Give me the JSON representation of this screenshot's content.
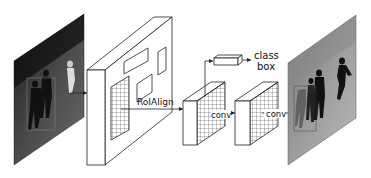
{
  "diagram": {
    "type": "mask-rcnn-architecture",
    "labels": {
      "roialign": "RoIAlign",
      "conv1": "conv",
      "conv2": "conv",
      "class": "class",
      "box": "box"
    },
    "nodes": [
      {
        "id": "input-image",
        "kind": "image",
        "description": "input photo of soccer players with bounding box"
      },
      {
        "id": "feature-map",
        "kind": "3d-slab",
        "description": "backbone feature map with region proposals"
      },
      {
        "id": "roi-feature",
        "kind": "3d-grid-block",
        "description": "RoI aligned feature"
      },
      {
        "id": "fc-head",
        "kind": "bar",
        "description": "class/box head"
      },
      {
        "id": "mask-feature",
        "kind": "3d-grid-block",
        "description": "conv mask feature"
      },
      {
        "id": "output-image",
        "kind": "image",
        "description": "output photo with instance masks"
      }
    ],
    "edges": [
      {
        "from": "input-image",
        "to": "feature-map"
      },
      {
        "from": "feature-map",
        "to": "roi-feature",
        "label": "RoIAlign"
      },
      {
        "from": "roi-feature",
        "to": "fc-head"
      },
      {
        "from": "fc-head",
        "to": "class/box"
      },
      {
        "from": "roi-feature",
        "to": "mask-feature",
        "label": "conv"
      },
      {
        "from": "mask-feature",
        "to": "output-image",
        "label": "conv"
      }
    ],
    "colors": {
      "stroke": "#222222",
      "background": "#ffffff"
    }
  }
}
